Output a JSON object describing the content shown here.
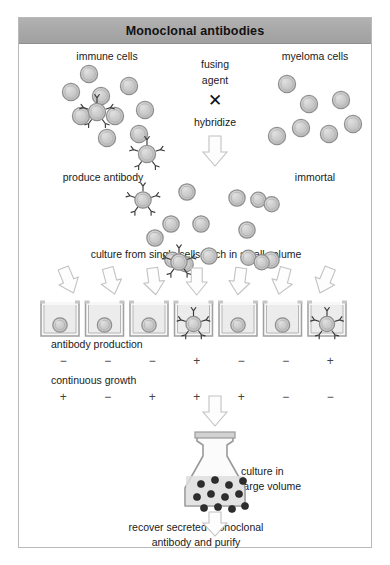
{
  "figure": {
    "title": "Monoclonal antibodies",
    "border_color": "#b9b9b9",
    "title_bar_color": "#a9a9a9"
  },
  "labels": {
    "immune_cells": "immune cells",
    "myeloma_cells": "myeloma cells",
    "fusing": "fusing",
    "agent": "agent",
    "cross_symbol": "✕",
    "hybridize": "hybridize",
    "produce_antibody": "produce  antibody",
    "immortal": "immortal",
    "culture_small": "culture from single cells each in small volume",
    "antibody_production": "antibody production",
    "continuous_growth": "continuous growth",
    "culture_large_line1": "culture in",
    "culture_large_line2": "large volume",
    "recover_line1": "recover secreted monoclonal",
    "recover_line2": "antibody and purify"
  },
  "colors": {
    "cell_fill": "#c9c9c9",
    "cell_rim": "#8e8e8e",
    "cell_highlight": "#dcdcdc",
    "arrow_stroke": "#c2c2c2",
    "well_stroke": "#a0a0a0",
    "well_fill": "#ececec",
    "flask_stroke": "#9a9a9a",
    "flask_cell": "#2e2e2e",
    "antibody_stroke": "#3a3a3a"
  },
  "results": {
    "well_count": 7,
    "antibody_production": [
      "−",
      "−",
      "−",
      "+",
      "−",
      "−",
      "+"
    ],
    "continuous_growth": [
      "+",
      "−",
      "+",
      "+",
      "+",
      "−",
      "−"
    ],
    "wells_with_antibody": [
      4,
      7
    ]
  },
  "cells": {
    "immune_plain": [
      [
        52,
        48
      ],
      [
        70,
        30
      ],
      [
        82,
        52
      ],
      [
        96,
        72
      ],
      [
        110,
        42
      ],
      [
        62,
        72
      ],
      [
        88,
        94
      ],
      [
        120,
        90
      ],
      [
        126,
        66
      ]
    ],
    "immune_antibody": [
      [
        78,
        68
      ],
      [
        128,
        110
      ]
    ],
    "myeloma": [
      [
        268,
        40
      ],
      [
        290,
        60
      ],
      [
        322,
        56
      ],
      [
        282,
        84
      ],
      [
        258,
        92
      ],
      [
        310,
        90
      ],
      [
        334,
        80
      ]
    ],
    "hybrid_plain": [
      [
        168,
        30
      ],
      [
        152,
        62
      ],
      [
        136,
        76
      ],
      [
        182,
        62
      ],
      [
        190,
        94
      ],
      [
        218,
        36
      ],
      [
        228,
        68
      ],
      [
        252,
        98
      ]
    ],
    "hybrid_fused": [
      [
        246,
        40
      ],
      [
        236,
        98
      ]
    ],
    "hybrid_antibody": [
      [
        124,
        38
      ],
      [
        160,
        100
      ]
    ],
    "flask_cells": [
      [
        10,
        10
      ],
      [
        24,
        6
      ],
      [
        38,
        11
      ],
      [
        52,
        7
      ],
      [
        6,
        23
      ],
      [
        20,
        20
      ],
      [
        34,
        23
      ],
      [
        48,
        20
      ],
      [
        13,
        34
      ],
      [
        27,
        33
      ],
      [
        41,
        35
      ],
      [
        54,
        32
      ]
    ]
  }
}
